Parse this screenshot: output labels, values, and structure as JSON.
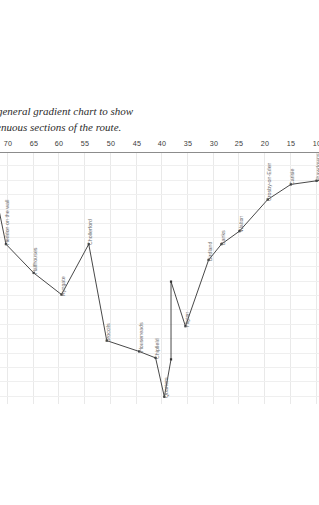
{
  "caption": {
    "line1": "This is a general gradient chart to show",
    "line2": "the strenuous sections of the route."
  },
  "chart_data": {
    "type": "line",
    "title": "",
    "subtitle": "",
    "xlabel": "",
    "ylabel": "",
    "grid": true,
    "legend": "none",
    "rotation_deg": 180,
    "xlim": [
      0,
      84
    ],
    "ylim": [
      0,
      350
    ],
    "xticks": [
      0,
      5,
      10,
      15,
      20,
      25,
      30,
      35,
      40,
      45,
      50,
      55,
      60,
      65,
      70,
      75,
      80,
      84
    ],
    "yticks": [
      0,
      20,
      40,
      60,
      80,
      100,
      120,
      140,
      160,
      180,
      200,
      220,
      240,
      260,
      280,
      300,
      320,
      340
    ],
    "x": [
      0.6,
      5.0,
      10.0,
      15.0,
      19.5,
      25.0,
      28.5,
      31.0,
      35.5,
      38.3,
      38.3,
      39.6,
      41.3,
      44.5,
      50.8,
      54.3,
      59.6,
      65.0,
      70.4,
      73.6,
      80.0,
      83.6
    ],
    "values": [
      8,
      34,
      40,
      45,
      66,
      110,
      128,
      150,
      242,
      180,
      288,
      340,
      286,
      277,
      262,
      128,
      198,
      168,
      128,
      16,
      10,
      30
    ],
    "labels": [
      "Stowes-on-Sovil",
      "Burgh-on-Stock",
      "Shawdowns",
      "Carisie",
      "Crosby-on-Eden",
      "Walton",
      "Banks",
      "Birdland",
      "Higton",
      "",
      "",
      "Quarters",
      "Chipfield",
      "Houseneads",
      "Broccils",
      "Chollerford",
      "Ryngate",
      "Halfhouses",
      "Heddon on the wall",
      "Newbury",
      "Tine Bridges",
      "Wallsend"
    ],
    "point_label_visible": [
      true,
      true,
      true,
      true,
      true,
      true,
      true,
      true,
      true,
      false,
      false,
      true,
      true,
      true,
      true,
      true,
      true,
      true,
      true,
      true,
      true,
      true
    ],
    "line_color": "#333333",
    "marker_color": "#333333",
    "grid_color": "#e9e9e9",
    "axis_color": "#8c8c8c",
    "tick_text_color": "#3a3a3a",
    "label_text_color": "#6d6d6d"
  }
}
